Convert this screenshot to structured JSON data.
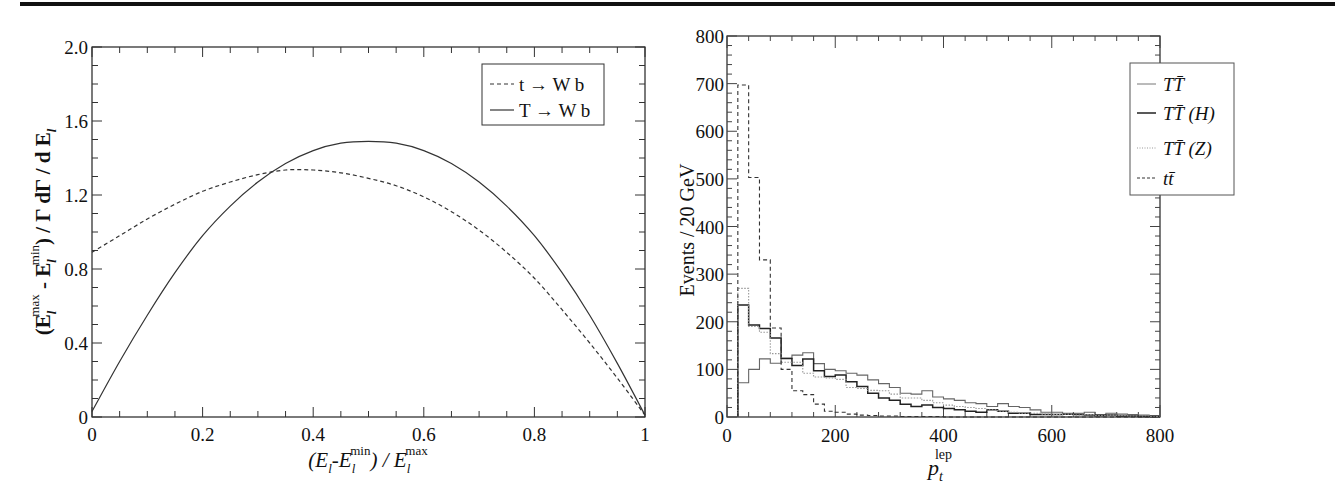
{
  "chart_data": [
    {
      "type": "line",
      "title": "",
      "xlabel": "(E_l - E_l^min) / E_l^max",
      "ylabel": "(E_l^max - E_l^min) / Γ dΓ / d E_l",
      "xlim": [
        0,
        1
      ],
      "ylim": [
        0,
        2.0
      ],
      "x_ticks": [
        "0",
        "0.2",
        "0.4",
        "0.6",
        "0.8",
        "1"
      ],
      "y_ticks": [
        "0",
        "0.4",
        "0.8",
        "1.2",
        "1.6",
        "2.0"
      ],
      "grid": false,
      "legend_position": "upper right",
      "x": [
        0,
        0.05,
        0.1,
        0.15,
        0.2,
        0.25,
        0.3,
        0.35,
        0.4,
        0.45,
        0.5,
        0.55,
        0.6,
        0.65,
        0.7,
        0.75,
        0.8,
        0.85,
        0.9,
        0.95,
        1.0
      ],
      "series": [
        {
          "name": "t → W b",
          "style": "dashed",
          "values": [
            0.89,
            0.98,
            1.07,
            1.15,
            1.22,
            1.27,
            1.31,
            1.335,
            1.335,
            1.32,
            1.29,
            1.25,
            1.19,
            1.11,
            1.01,
            0.89,
            0.75,
            0.58,
            0.4,
            0.21,
            0.01
          ]
        },
        {
          "name": "T → W b",
          "style": "solid",
          "values": [
            0.03,
            0.3,
            0.55,
            0.78,
            0.98,
            1.14,
            1.27,
            1.37,
            1.44,
            1.48,
            1.49,
            1.48,
            1.44,
            1.37,
            1.27,
            1.14,
            0.98,
            0.78,
            0.55,
            0.29,
            0.01
          ]
        }
      ]
    },
    {
      "type": "bar",
      "subtype": "step-histogram",
      "title": "",
      "xlabel": "p_t^lep",
      "ylabel": "Events / 20 GeV",
      "xlim": [
        0,
        800
      ],
      "ylim": [
        0,
        800
      ],
      "x_ticks": [
        "0",
        "200",
        "400",
        "600",
        "800"
      ],
      "y_ticks": [
        "0",
        "100",
        "200",
        "300",
        "400",
        "500",
        "600",
        "700",
        "800"
      ],
      "grid": false,
      "legend_position": "upper right",
      "bin_width": 20,
      "categories": [
        20,
        40,
        60,
        80,
        100,
        120,
        140,
        160,
        180,
        200,
        220,
        240,
        260,
        280,
        300,
        320,
        340,
        360,
        380,
        400,
        420,
        440,
        460,
        480,
        500,
        520,
        540,
        560,
        580,
        600,
        620,
        640,
        660,
        680,
        700,
        720,
        740,
        760,
        780
      ],
      "series": [
        {
          "name": "TT̄",
          "style": "solid-thin",
          "values": [
            72,
            100,
            122,
            113,
            123,
            130,
            135,
            112,
            100,
            97,
            92,
            88,
            78,
            70,
            62,
            50,
            48,
            55,
            42,
            38,
            35,
            30,
            28,
            22,
            28,
            22,
            20,
            15,
            10,
            10,
            8,
            8,
            10,
            5,
            8,
            6,
            5,
            4,
            3
          ]
        },
        {
          "name": "TT̄ (H)",
          "style": "solid-thick",
          "values": [
            235,
            193,
            186,
            166,
            123,
            108,
            122,
            97,
            85,
            88,
            74,
            64,
            50,
            40,
            35,
            27,
            22,
            25,
            20,
            18,
            15,
            12,
            10,
            15,
            12,
            8,
            8,
            5,
            5,
            5,
            6,
            5,
            4,
            3,
            4,
            2,
            2,
            1,
            1
          ]
        },
        {
          "name": "TT̄ (Z)",
          "style": "dotted",
          "values": [
            270,
            190,
            178,
            133,
            115,
            115,
            92,
            84,
            82,
            79,
            62,
            60,
            56,
            55,
            48,
            40,
            40,
            35,
            30,
            25,
            22,
            20,
            18,
            15,
            12,
            10,
            8,
            8,
            6,
            5,
            6,
            4,
            5,
            3,
            4,
            3,
            2,
            2,
            1
          ]
        },
        {
          "name": "tt̄",
          "style": "dashed",
          "values": [
            697,
            503,
            330,
            187,
            100,
            55,
            47,
            27,
            12,
            10,
            6,
            4,
            3,
            2,
            2,
            1,
            1,
            1,
            1,
            0,
            0,
            0,
            0,
            0,
            0,
            0,
            0,
            0,
            0,
            0,
            0,
            0,
            0,
            0,
            0,
            0,
            0,
            0,
            0
          ]
        }
      ]
    }
  ],
  "left_plot": {
    "ylabel": {
      "open": "(E",
      "sub1": "l",
      "sup1": "max",
      "minus": " - E",
      "sub2": "l",
      "sup2": "min",
      "rest": ") / Γ dΓ / d E",
      "sub3": "l"
    },
    "xlabel": {
      "open": "(E",
      "sub1": "l",
      "mid": "-E",
      "sub2": "l",
      "sup2": "min",
      "rest": ") /  E",
      "sub3": "l",
      "sup3": "max"
    },
    "legend": [
      {
        "label": "t → W b"
      },
      {
        "label": "T → W b"
      }
    ]
  },
  "right_plot": {
    "ylabel": "Events / 20 GeV",
    "xlabel": {
      "base": "p",
      "sub": "t",
      "sup": "lep"
    },
    "legend": [
      {
        "label": "TT̄"
      },
      {
        "label": "TT̄ (H)"
      },
      {
        "label": "TT̄ (Z)"
      },
      {
        "label": "tt̄"
      }
    ]
  }
}
